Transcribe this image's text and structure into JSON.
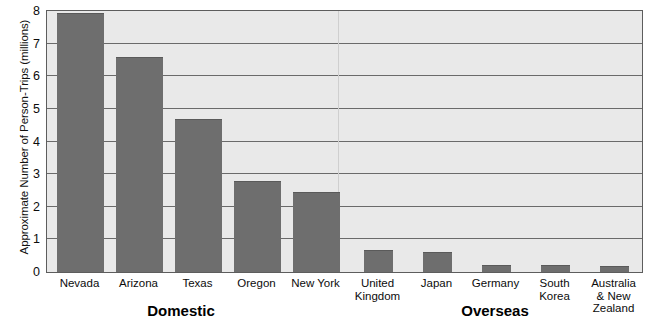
{
  "chart_data": {
    "type": "bar",
    "title": "",
    "xlabel": "",
    "ylabel": "Approximate Number of Person-Trips (millions)",
    "ylim": [
      0,
      8
    ],
    "yticks": [
      "0",
      "1",
      "2",
      "3",
      "4",
      "5",
      "6",
      "7",
      "8"
    ],
    "grid": true,
    "legend": "none",
    "bar_color": "#6e6e6e",
    "plot_background": "#e9e9e9",
    "axis_color": "#5d5d5d",
    "categories": [
      "Nevada",
      "Arizona",
      "Texas",
      "Oregon",
      "New York",
      "United\nKingdom",
      "Japan",
      "Germany",
      "South\nKorea",
      "Australia\n& New\nZealand"
    ],
    "values": [
      7.95,
      6.58,
      4.68,
      2.78,
      2.45,
      0.67,
      0.6,
      0.2,
      0.2,
      0.18
    ],
    "groups": [
      {
        "label": "Domestic",
        "categories": [
          "Nevada",
          "Arizona",
          "Texas",
          "Oregon",
          "New York"
        ]
      },
      {
        "label": "Overseas",
        "categories": [
          "United Kingdom",
          "Japan",
          "Germany",
          "South Korea",
          "Australia & New Zealand"
        ]
      }
    ]
  },
  "bars": [
    {
      "label": "Nevada",
      "value": 7.95,
      "group": "Domestic",
      "left": 10,
      "width": 47
    },
    {
      "label": "Arizona",
      "value": 6.58,
      "group": "Domestic",
      "left": 69,
      "width": 47
    },
    {
      "label": "Texas",
      "value": 4.68,
      "group": "Domestic",
      "left": 128,
      "width": 47
    },
    {
      "label": "Oregon",
      "value": 2.78,
      "group": "Domestic",
      "left": 187,
      "width": 47
    },
    {
      "label": "New York",
      "value": 2.45,
      "group": "Domestic",
      "left": 246,
      "width": 47
    },
    {
      "label": "United\nKingdom",
      "value": 0.67,
      "group": "Overseas",
      "left": 317,
      "width": 29
    },
    {
      "label": "Japan",
      "value": 0.6,
      "group": "Overseas",
      "left": 376,
      "width": 29
    },
    {
      "label": "Germany",
      "value": 0.2,
      "group": "Overseas",
      "left": 435,
      "width": 29
    },
    {
      "label": "South\nKorea",
      "value": 0.2,
      "group": "Overseas",
      "left": 494,
      "width": 29
    },
    {
      "label": "Australia\n& New\nZealand",
      "value": 0.18,
      "group": "Overseas",
      "left": 553,
      "width": 29
    }
  ],
  "y_axis": {
    "title": "Approximate Number of Person-Trips (millions)",
    "ticks": [
      {
        "label": "8",
        "value": 8
      },
      {
        "label": "7",
        "value": 7
      },
      {
        "label": "6",
        "value": 6
      },
      {
        "label": "5",
        "value": 5
      },
      {
        "label": "4",
        "value": 4
      },
      {
        "label": "3",
        "value": 3
      },
      {
        "label": "2",
        "value": 2
      },
      {
        "label": "1",
        "value": 1
      },
      {
        "label": "0",
        "value": 0
      }
    ]
  },
  "group_labels": [
    {
      "text": "Domestic",
      "center": 181
    },
    {
      "text": "Overseas",
      "center": 495
    }
  ]
}
